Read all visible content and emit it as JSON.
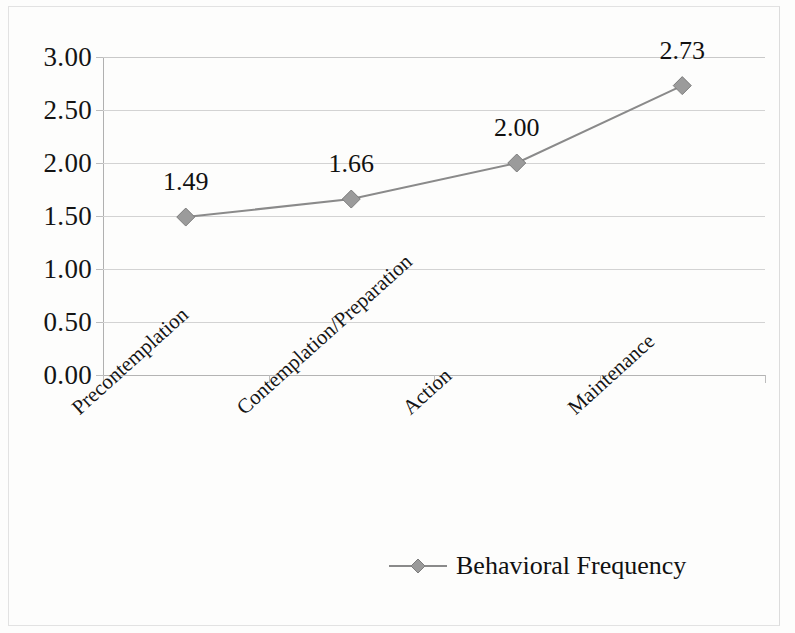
{
  "figure": {
    "background_color": "#fdfdfc",
    "frame_color": "#e2e2e2"
  },
  "chart_data": {
    "type": "line",
    "title": "",
    "subtitle": "",
    "xlabel": "",
    "ylabel": "",
    "categories": [
      "Precontemplation",
      "Contemplation/Preparation",
      "Action",
      "Maintenance"
    ],
    "series": [
      {
        "name": "Behavioral Frequency",
        "values": [
          1.49,
          1.66,
          2.0,
          2.73
        ],
        "color": "#8a8a8a",
        "marker": "diamond"
      }
    ],
    "point_labels": [
      "1.49",
      "1.66",
      "2.00",
      "2.73"
    ],
    "ylim": [
      0.0,
      3.0
    ],
    "ytick_values": [
      3.0,
      2.5,
      2.0,
      1.5,
      1.0,
      0.5,
      0.0
    ],
    "ytick_labels": [
      "3.00",
      "2.50",
      "2.00",
      "1.50",
      "1.00",
      "0.50",
      "0.00"
    ],
    "grid": true,
    "grid_color": "#d3d3d3",
    "legend_position": "bottom",
    "legend_entries": [
      "Behavioral Frequency"
    ]
  },
  "legend": {
    "label": "Behavioral Frequency",
    "marker_icon": "diamond-marker-icon",
    "line_color": "#8a8a8a"
  }
}
